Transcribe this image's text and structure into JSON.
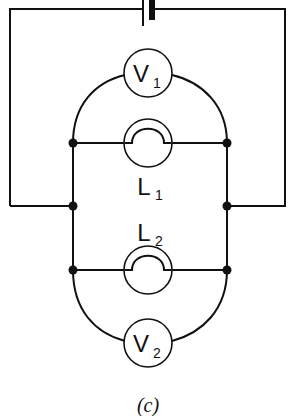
{
  "diagram": {
    "type": "circuit",
    "caption": "(c)",
    "components": {
      "battery": {
        "label": ""
      },
      "voltmeter_1": {
        "letter": "V",
        "sub": "1"
      },
      "lamp_1": {
        "letter": "L",
        "sub": "1"
      },
      "lamp_2": {
        "letter": "L",
        "sub": "2"
      },
      "voltmeter_2": {
        "letter": "V",
        "sub": "2"
      }
    },
    "colors": {
      "ink": "#111111",
      "background": "#ffffff"
    }
  }
}
